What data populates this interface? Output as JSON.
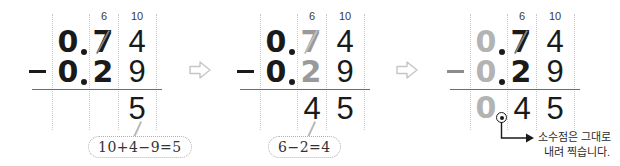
{
  "document": {
    "title": "Decimal subtraction worked example",
    "background_color": "#ffffff",
    "ink_color": "#1a1a1a",
    "faded_ink_color": "#b3b3b3",
    "guide_color": "#c9c9c9"
  },
  "steps": [
    {
      "id": "step-1",
      "regroup": {
        "tenths": "6",
        "hundredths": "10"
      },
      "minuend": {
        "ones": "0",
        "point": ".",
        "tenths": "7",
        "hundredths": "4"
      },
      "operator": "−",
      "subtrahend": {
        "ones": "0",
        "point": ".",
        "tenths": "2",
        "hundredths": "9"
      },
      "difference": {
        "ones": "",
        "point": "",
        "tenths": "",
        "hundredths": "5"
      },
      "callout": "10+4−9=5"
    },
    {
      "id": "step-2",
      "regroup": {
        "tenths": "6",
        "hundredths": "10"
      },
      "minuend": {
        "ones": "0",
        "point": ".",
        "tenths": "7",
        "hundredths": "4"
      },
      "operator": "−",
      "subtrahend": {
        "ones": "0",
        "point": ".",
        "tenths": "2",
        "hundredths": "9"
      },
      "difference": {
        "ones": "",
        "point": "",
        "tenths": "4",
        "hundredths": "5"
      },
      "callout": "6−2=4"
    },
    {
      "id": "step-3",
      "regroup": {
        "tenths": "6",
        "hundredths": "10"
      },
      "minuend": {
        "ones": "0",
        "point": ".",
        "tenths": "7",
        "hundredths": "4"
      },
      "operator": "−",
      "subtrahend": {
        "ones": "0",
        "point": ".",
        "tenths": "2",
        "hundredths": "9"
      },
      "difference": {
        "ones": "0",
        "point": ".",
        "tenths": "4",
        "hundredths": "5"
      },
      "note_line_1": "소수점은 그대로",
      "note_line_2": "내려 찍습니다."
    }
  ],
  "transitions": [
    {
      "id": "transition-1",
      "icon": "arrow-right-outline"
    },
    {
      "id": "transition-2",
      "icon": "arrow-right-outline"
    }
  ]
}
